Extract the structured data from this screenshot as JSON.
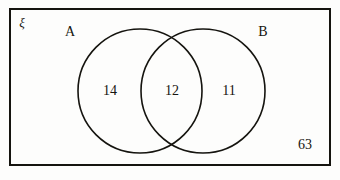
{
  "figure": {
    "type": "venn-diagram-two-sets",
    "universal_set_symbol": "ξ",
    "outside_count": "63",
    "colors": {
      "stroke": "#15140f",
      "background": "#fdfdfc",
      "text": "#15140f"
    },
    "rectangle": {
      "label": "ξ",
      "x": 10,
      "y": 9,
      "width": 320,
      "height": 156,
      "stroke_width": 2
    },
    "sets": [
      {
        "name": "set-a",
        "label": "A",
        "label_x": 70,
        "label_y": 32,
        "cx": 140,
        "cy": 91,
        "r": 62
      },
      {
        "name": "set-b",
        "label": "B",
        "label_x": 263,
        "label_y": 32,
        "cx": 203,
        "cy": 91,
        "r": 62
      }
    ],
    "regions": [
      {
        "name": "a-only",
        "value": "14",
        "x": 110,
        "y": 91
      },
      {
        "name": "intersection",
        "value": "12",
        "x": 172,
        "y": 91
      },
      {
        "name": "b-only",
        "value": "11",
        "x": 229,
        "y": 91
      },
      {
        "name": "outside",
        "value": "63",
        "x": 305,
        "y": 145
      }
    ]
  }
}
